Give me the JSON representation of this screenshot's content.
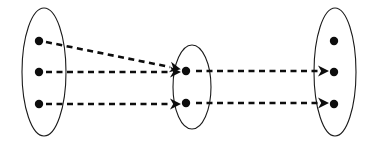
{
  "diagram": {
    "kind": "set-mapping-diagram",
    "canvas": {
      "width": 371,
      "height": 144,
      "background": "#ffffff"
    },
    "style": {
      "ellipse_stroke": "#1a1a1a",
      "ellipse_stroke_width": 1.1,
      "ellipse_fill": "#ffffff",
      "dot_fill": "#0d0d0d",
      "dot_radius": 4.2,
      "arrow_stroke": "#0d0d0d",
      "arrow_stroke_width": 2.6,
      "arrow_dash": "6,4.5"
    },
    "sets": [
      {
        "id": "set-left",
        "name": "left-set",
        "label": "",
        "cx": 44,
        "cy": 72,
        "rx": 22,
        "ry": 64,
        "elements": [
          {
            "id": "l1",
            "name": "left-element-1",
            "label": "",
            "cx": 39,
            "cy": 41
          },
          {
            "id": "l2",
            "name": "left-element-2",
            "label": "",
            "cx": 39,
            "cy": 72
          },
          {
            "id": "l3",
            "name": "left-element-3",
            "label": "",
            "cx": 39,
            "cy": 104
          }
        ]
      },
      {
        "id": "set-middle",
        "name": "middle-set",
        "label": "",
        "cx": 192,
        "cy": 87,
        "rx": 19,
        "ry": 42,
        "elements": [
          {
            "id": "m1",
            "name": "middle-element-1",
            "label": "",
            "cx": 186,
            "cy": 71
          },
          {
            "id": "m2",
            "name": "middle-element-2",
            "label": "",
            "cx": 186,
            "cy": 103
          }
        ]
      },
      {
        "id": "set-right",
        "name": "right-set",
        "label": "",
        "cx": 335,
        "cy": 72,
        "rx": 21,
        "ry": 64,
        "elements": [
          {
            "id": "r1",
            "name": "right-element-1",
            "label": "",
            "cx": 334,
            "cy": 41
          },
          {
            "id": "r2",
            "name": "right-element-2",
            "label": "",
            "cx": 334,
            "cy": 72
          },
          {
            "id": "r3",
            "name": "right-element-3",
            "label": "",
            "cx": 334,
            "cy": 104
          }
        ]
      }
    ],
    "arrows": [
      {
        "id": "a1",
        "name": "arrow-left1-to-middle1",
        "from": "l1",
        "to": "m1",
        "label": "",
        "x1": 46,
        "y1": 42,
        "x2": 170,
        "y2": 67
      },
      {
        "id": "a2",
        "name": "arrow-left2-to-middle1",
        "from": "l2",
        "to": "m1",
        "label": "",
        "x1": 46,
        "y1": 72,
        "x2": 170,
        "y2": 72
      },
      {
        "id": "a3",
        "name": "arrow-left3-to-middle2",
        "from": "l3",
        "to": "m2",
        "label": "",
        "x1": 46,
        "y1": 104,
        "x2": 170,
        "y2": 104
      },
      {
        "id": "a4",
        "name": "arrow-middle1-to-right2",
        "from": "m1",
        "to": "r2",
        "label": "",
        "x1": 196,
        "y1": 71,
        "x2": 318,
        "y2": 71
      },
      {
        "id": "a5",
        "name": "arrow-middle2-to-right3",
        "from": "m2",
        "to": "r3",
        "label": "",
        "x1": 196,
        "y1": 103,
        "x2": 318,
        "y2": 103
      }
    ]
  }
}
